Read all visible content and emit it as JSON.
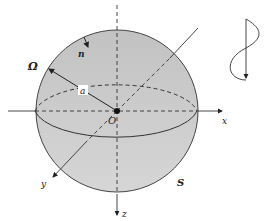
{
  "diagram": {
    "type": "sphere-coordinate-diagram",
    "labels": {
      "domain": "Ω",
      "normal": "n",
      "radius": "a",
      "origin": "O",
      "x_axis": "x",
      "y_axis": "y",
      "z_axis": "z",
      "surface": "S"
    },
    "colors": {
      "sphere_top": "#c4c4c4",
      "sphere_bottom": "#d2d2d2",
      "stroke": "#333333",
      "background": "#ffffff"
    }
  }
}
